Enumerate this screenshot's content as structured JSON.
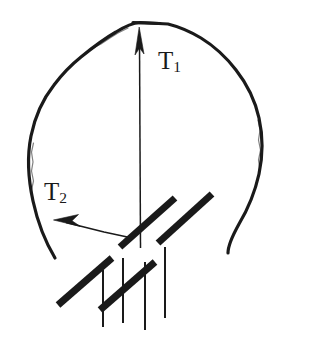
{
  "figure": {
    "type": "line-diagram",
    "background_color": "#ffffff",
    "ink_color": "#1a1a1a",
    "width": 314,
    "height": 348
  },
  "labels": {
    "t1": {
      "base": "T",
      "sub": "1"
    },
    "t2": {
      "base": "T",
      "sub": "2"
    }
  },
  "arrows": [
    {
      "name": "t1-arrow",
      "label": "T1",
      "direction": "up",
      "tail": [
        140,
        248
      ],
      "head": [
        139,
        28
      ],
      "arrowhead": "filled-narrow-triangle"
    },
    {
      "name": "t2-arrow",
      "label": "T2",
      "direction": "left",
      "tail": [
        131,
        238
      ],
      "head": [
        54,
        220
      ],
      "arrowhead": "filled-narrow-triangle"
    }
  ],
  "head_outline": {
    "name": "head-contour",
    "style": "hand-drawn open curve",
    "stroke_width": 3,
    "open_gap": "bottom (neck region)",
    "left_terminus": [
      55,
      258
    ],
    "right_terminus": [
      228,
      253
    ],
    "apex": [
      140,
      23
    ]
  },
  "support_hatching": {
    "name": "fixed-support-hatch",
    "thick_bar_angle_deg": 45,
    "thick_bar_count": 4,
    "thick_bars": [
      {
        "x1": 58,
        "y1": 305,
        "x2": 112,
        "y2": 258
      },
      {
        "x1": 100,
        "y1": 310,
        "x2": 155,
        "y2": 262
      },
      {
        "x1": 120,
        "y1": 247,
        "x2": 175,
        "y2": 198
      },
      {
        "x1": 158,
        "y1": 243,
        "x2": 212,
        "y2": 194
      }
    ],
    "vertical_line_count": 4,
    "vertical_lines": [
      {
        "x": 103,
        "y1": 270,
        "y2": 327
      },
      {
        "x": 123,
        "y1": 258,
        "y2": 323
      },
      {
        "x": 145,
        "y1": 262,
        "y2": 330
      },
      {
        "x": 165,
        "y1": 247,
        "y2": 318
      }
    ],
    "thick_bar_width": 7,
    "vertical_line_width": 2
  }
}
